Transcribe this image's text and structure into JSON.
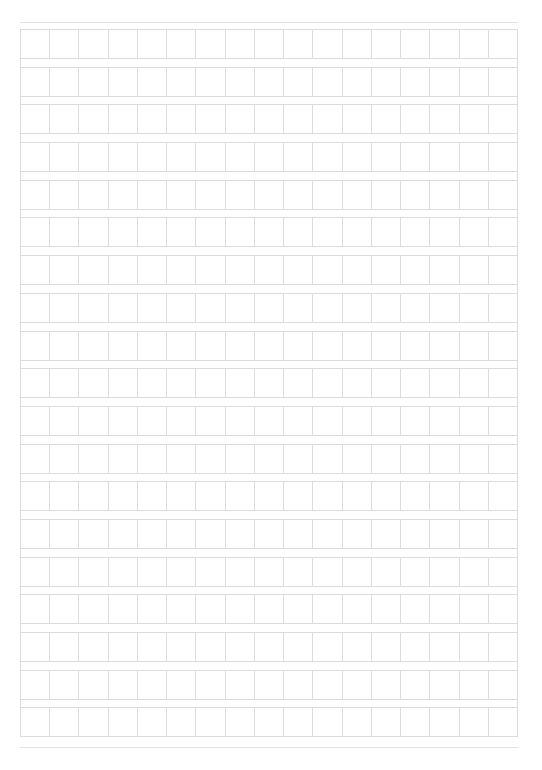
{
  "page": {
    "type": "manuscript-grid-paper",
    "rows": 19,
    "columns": 17,
    "line_color": "#dcdcdc",
    "rule_color": "#e2e2e2",
    "background": "#ffffff"
  }
}
